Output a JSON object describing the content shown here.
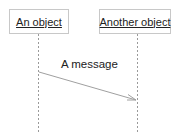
{
  "diagram": {
    "type": "sequence",
    "objects": [
      {
        "label": "An object"
      },
      {
        "label": "Another object"
      }
    ],
    "messages": [
      {
        "from": 0,
        "to": 1,
        "label": "A message"
      }
    ],
    "colors": {
      "line": "#999999",
      "box_border": "#c8c8c8",
      "text": "#222222"
    }
  }
}
